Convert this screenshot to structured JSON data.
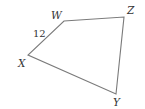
{
  "figure": {
    "type": "quadrilateral",
    "vertices": [
      {
        "name": "W",
        "x": 64,
        "y": 21,
        "label_x": 51,
        "label_y": 19
      },
      {
        "name": "Z",
        "x": 124,
        "y": 17,
        "label_x": 127,
        "label_y": 14
      },
      {
        "name": "Y",
        "x": 116,
        "y": 94,
        "label_x": 113,
        "label_y": 106
      },
      {
        "name": "X",
        "x": 28,
        "y": 55,
        "label_x": 18,
        "label_y": 67
      }
    ],
    "side_labels": [
      {
        "side": "WX",
        "text": "12",
        "x": 33,
        "y": 37
      }
    ],
    "edge_color": "#7a7a7a",
    "text_color": "#333333"
  }
}
